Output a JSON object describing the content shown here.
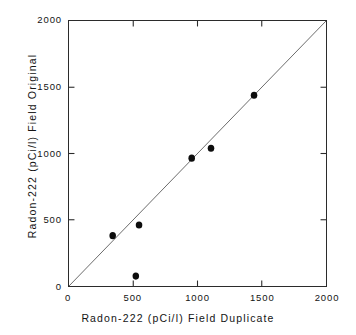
{
  "chart_data": {
    "type": "scatter",
    "title": "",
    "subtitle": "",
    "xlabel": "Radon-222  (pCi/l)   Field  Duplicate",
    "ylabel": "Radon-222  (pCi/l)   Field  Original",
    "xlim": [
      0,
      2000
    ],
    "ylim": [
      0,
      2000
    ],
    "xticks": [
      0,
      500,
      1000,
      1500,
      2000
    ],
    "yticks": [
      0,
      500,
      1000,
      1500,
      2000
    ],
    "xtick_labels": [
      "0",
      "500",
      "1000",
      "1500",
      "2000"
    ],
    "ytick_labels": [
      "0",
      "500",
      "1000",
      "1500",
      "2000"
    ],
    "grid": false,
    "legend": null,
    "series": [
      {
        "name": "Field duplicate vs field original",
        "marker": "filled-circle",
        "color": "#0d0d0d",
        "points": [
          {
            "x": 340,
            "y": 380
          },
          {
            "x": 520,
            "y": 75
          },
          {
            "x": 545,
            "y": 460
          },
          {
            "x": 955,
            "y": 965
          },
          {
            "x": 1105,
            "y": 1040
          },
          {
            "x": 1440,
            "y": 1440
          }
        ]
      }
    ],
    "reference_line": {
      "name": "1:1 identity line",
      "from": {
        "x": 0,
        "y": 0
      },
      "to": {
        "x": 2000,
        "y": 2000
      },
      "color": "#5a5a5a"
    },
    "axis_color": "#2b2b2b",
    "background": "#ffffff"
  },
  "axes": {
    "x_title": "Radon-222  (pCi/l)   Field  Duplicate",
    "y_title": "Radon-222  (pCi/l)   Field  Original"
  }
}
